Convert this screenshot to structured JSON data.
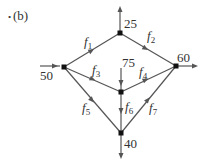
{
  "figure": {
    "label": "(b)",
    "bullet": "•"
  },
  "nodes": [
    {
      "id": "A",
      "x": 64,
      "y": 67
    },
    {
      "id": "B",
      "x": 120,
      "y": 33
    },
    {
      "id": "C",
      "x": 176,
      "y": 66
    },
    {
      "id": "D",
      "x": 121,
      "y": 92
    },
    {
      "id": "E",
      "x": 121,
      "y": 133
    }
  ],
  "external_flows": {
    "in_left": {
      "value": "50",
      "node": "A",
      "direction": "in"
    },
    "out_top": {
      "value": "25",
      "node": "B",
      "direction": "out"
    },
    "out_right": {
      "value": "60",
      "node": "C",
      "direction": "out"
    },
    "in_center": {
      "value": "75",
      "node": "D",
      "direction": "in"
    },
    "out_bottom": {
      "value": "40",
      "node": "E",
      "direction": "out"
    }
  },
  "edges": [
    {
      "name": "f",
      "sub": "1",
      "from": "A",
      "to": "B"
    },
    {
      "name": "f",
      "sub": "2",
      "from": "B",
      "to": "C"
    },
    {
      "name": "f",
      "sub": "3",
      "from": "A",
      "to": "D"
    },
    {
      "name": "f",
      "sub": "4",
      "from": "D",
      "to": "C"
    },
    {
      "name": "f",
      "sub": "5",
      "from": "A",
      "to": "E"
    },
    {
      "name": "f",
      "sub": "6",
      "from": "D",
      "to": "E"
    },
    {
      "name": "f",
      "sub": "7",
      "from": "E",
      "to": "C"
    }
  ],
  "colors": {
    "edge": "#555555",
    "node": "#111111",
    "text": "#333333"
  }
}
